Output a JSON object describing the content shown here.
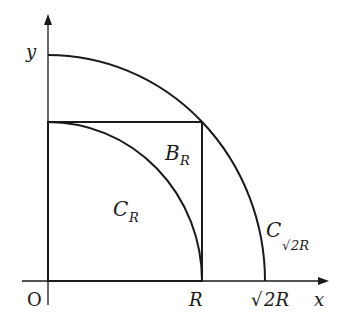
{
  "diagram": {
    "axes": {
      "x_label": "x",
      "y_label": "y",
      "origin_label": "O"
    },
    "ticks": {
      "r": "R",
      "sqrt2r_root": "√",
      "sqrt2r_rest": "2R"
    },
    "regions": {
      "c_r": {
        "main": "C",
        "sub": "R"
      },
      "b_r": {
        "main": "B",
        "sub": "R"
      },
      "c_sqrt2r": {
        "main": "C",
        "sub_root": "√",
        "sub_rest": "2R"
      }
    },
    "colors": {
      "stroke": "#1a1a1a",
      "background": "#ffffff"
    }
  }
}
